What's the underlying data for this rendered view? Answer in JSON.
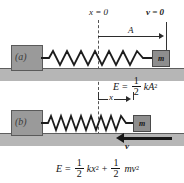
{
  "figure": {
    "type": "physics-diagram",
    "panels": [
      {
        "id": "a",
        "label": "(a)",
        "state": "block at maximum displacement, momentarily at rest",
        "annotations": {
          "origin_label": "x = 0",
          "velocity_label": "v = 0",
          "displacement_label": "A"
        },
        "energy_equation": {
          "lhs": "E",
          "equals": "=",
          "terms": [
            {
              "numerator": "1",
              "denominator": "2",
              "coefficient": "kA",
              "exponent": "2"
            }
          ]
        }
      },
      {
        "id": "b",
        "label": "(b)",
        "state": "block at displacement x moving toward the left",
        "annotations": {
          "displacement_label": "x",
          "velocity_label": "v"
        },
        "energy_equation": {
          "lhs": "E",
          "equals": "=",
          "plus": "+",
          "terms": [
            {
              "numerator": "1",
              "denominator": "2",
              "coefficient": "kx",
              "exponent": "2"
            },
            {
              "numerator": "1",
              "denominator": "2",
              "coefficient": "mv",
              "exponent": "2"
            }
          ]
        }
      }
    ],
    "mass_label": "m",
    "icons": {
      "wall": "wall-hatch-icon",
      "spring": "coil-spring-icon",
      "ground": "ground-surface-icon",
      "right_arrow": "arrow-right-icon",
      "left_arrow": "arrow-left-icon",
      "dashed_reference": "dashed-reference-line-icon"
    },
    "colors": {
      "background": "#ffffff",
      "ground": "#b6b6b6",
      "wall": "#9a9a9a",
      "mass": "#8e8e8e",
      "ink": "#1a1a1a",
      "dashed": "#555555"
    }
  }
}
